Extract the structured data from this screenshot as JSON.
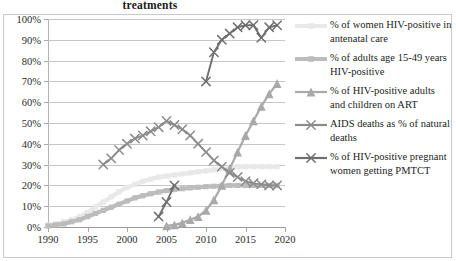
{
  "chart_title": "treatments",
  "axis": {
    "y_ticks": [
      "0%",
      "10%",
      "20%",
      "30%",
      "40%",
      "50%",
      "60%",
      "70%",
      "80%",
      "90%",
      "100%"
    ],
    "x_ticks": [
      "1990",
      "1995",
      "2000",
      "2005",
      "2010",
      "2015",
      "2020"
    ]
  },
  "legend": {
    "items": [
      {
        "label": "% of women HIV-positive in antenatal care",
        "marker": "line-square-marker",
        "color": "#e8e8e8"
      },
      {
        "label": "% of adults age 15-49 years HIV-positive",
        "marker": "line-square-marker",
        "color": "#bcbcbc"
      },
      {
        "label": "% of HIV-positive adults and children on ART",
        "marker": "line-triangle-marker",
        "color": "#a9a9a9"
      },
      {
        "label": "AIDS deaths as % of natural deaths",
        "marker": "line-x-marker",
        "color": "#8c8c8c"
      },
      {
        "label": "% of HIV-positive pregnant women getting PMTCT",
        "marker": "line-x-marker",
        "color": "#6f6f6f"
      }
    ]
  },
  "chart_data": {
    "type": "line",
    "title": "treatments",
    "xlabel": "",
    "ylabel": "",
    "xlim": [
      1990,
      2020
    ],
    "ylim": [
      0,
      100
    ],
    "grid": true,
    "legend_position": "right",
    "x_tick_values": [
      1990,
      1995,
      2000,
      2005,
      2010,
      2015,
      2020
    ],
    "y_tick_values": [
      0,
      10,
      20,
      30,
      40,
      50,
      60,
      70,
      80,
      90,
      100
    ],
    "series": [
      {
        "name": "% of women HIV-positive in antenatal care",
        "color": "#e8e8e8",
        "marker": "square",
        "x": [
          1990,
          1991,
          1992,
          1993,
          1994,
          1995,
          1996,
          1997,
          1998,
          1999,
          2000,
          2001,
          2002,
          2003,
          2004,
          2005,
          2006,
          2007,
          2008,
          2009,
          2010,
          2011,
          2012,
          2013,
          2014,
          2015,
          2016,
          2017,
          2018,
          2019
        ],
        "values": [
          1,
          1.5,
          2.5,
          3.5,
          5,
          7,
          9.5,
          12,
          14.5,
          17,
          19,
          20.5,
          22,
          23,
          24,
          24.5,
          25,
          25.5,
          26,
          26.5,
          27,
          27.5,
          28,
          28.5,
          29,
          29,
          29,
          29,
          29,
          29
        ]
      },
      {
        "name": "% of adults age 15-49 years HIV-positive",
        "color": "#bcbcbc",
        "marker": "square",
        "x": [
          1990,
          1991,
          1992,
          1993,
          1994,
          1995,
          1996,
          1997,
          1998,
          1999,
          2000,
          2001,
          2002,
          2003,
          2004,
          2005,
          2006,
          2007,
          2008,
          2009,
          2010,
          2011,
          2012,
          2013,
          2014,
          2015,
          2016,
          2017,
          2018,
          2019
        ],
        "values": [
          0.5,
          1,
          1.5,
          2.5,
          3.5,
          5,
          6.5,
          8,
          9.5,
          11,
          12.5,
          14,
          15,
          16,
          16.8,
          17.5,
          18,
          18.4,
          18.8,
          19.1,
          19.4,
          19.6,
          19.8,
          20,
          20,
          20,
          20,
          20,
          20,
          20
        ]
      },
      {
        "name": "% of HIV-positive adults and children on ART",
        "color": "#a9a9a9",
        "marker": "triangle",
        "x": [
          2005,
          2006,
          2007,
          2008,
          2009,
          2010,
          2011,
          2012,
          2013,
          2014,
          2015,
          2016,
          2017,
          2018,
          2019
        ],
        "values": [
          0.5,
          1,
          2,
          3.5,
          5,
          8,
          13,
          20,
          28,
          36,
          44,
          51,
          58,
          64,
          69
        ]
      },
      {
        "name": "AIDS deaths as % of natural deaths",
        "color": "#8c8c8c",
        "marker": "x",
        "x": [
          1997,
          1998,
          1999,
          2000,
          2001,
          2002,
          2003,
          2004,
          2005,
          2006,
          2007,
          2008,
          2009,
          2010,
          2011,
          2012,
          2013,
          2014,
          2015,
          2016,
          2017,
          2018,
          2019
        ],
        "values": [
          30,
          33,
          37,
          40,
          42.5,
          44,
          46,
          48,
          51,
          49,
          47,
          44,
          40,
          36,
          32,
          29,
          26,
          24,
          22,
          21,
          20.5,
          20,
          20
        ]
      },
      {
        "name": "% of HIV-positive pregnant women getting PMTCT",
        "color": "#6f6f6f",
        "marker": "x",
        "segments": [
          {
            "x": [
              2004,
              2005,
              2006
            ],
            "values": [
              5,
              12,
              20
            ]
          },
          {
            "x": [
              2010,
              2011,
              2012,
              2013,
              2014,
              2015,
              2016,
              2017,
              2018,
              2019
            ],
            "values": [
              70,
              84,
              90,
              93,
              96,
              97,
              97,
              91,
              96,
              97
            ]
          }
        ]
      }
    ]
  }
}
